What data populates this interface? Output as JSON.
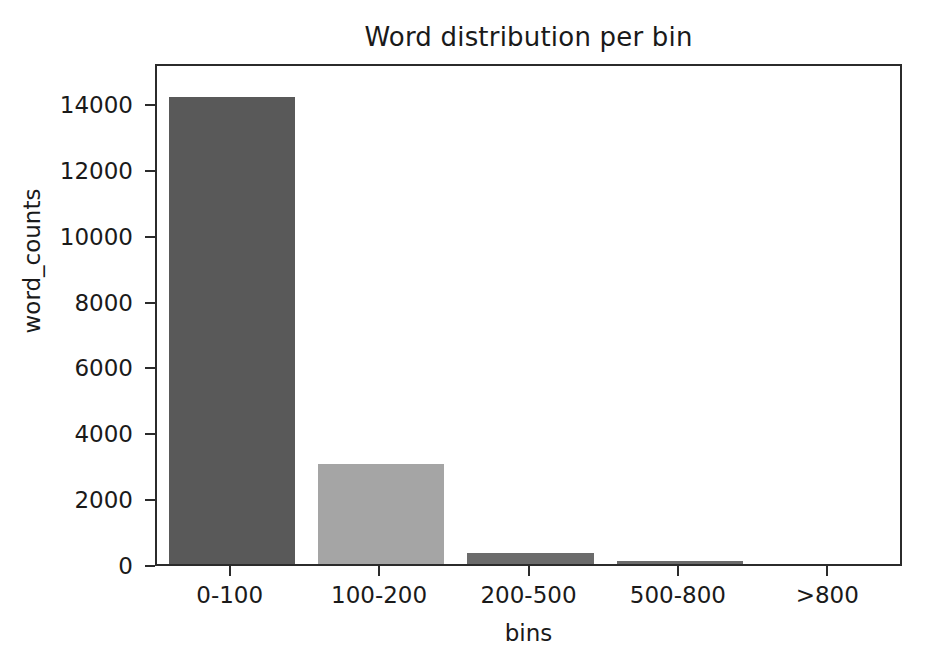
{
  "chart_data": {
    "type": "bar",
    "title": "Word distribution per bin",
    "xlabel": "bins",
    "ylabel": "word_counts",
    "categories": [
      "0-100",
      "100-200",
      "200-500",
      "500-800",
      ">800"
    ],
    "values": [
      14200,
      3050,
      330,
      80,
      10
    ],
    "bar_colors": [
      "#595959",
      "#a5a5a5",
      "#6b6b6b",
      "#6b6b6b",
      "#6b6b6b"
    ],
    "ylim": [
      0,
      15250
    ],
    "yticks": [
      0,
      2000,
      4000,
      6000,
      8000,
      10000,
      12000,
      14000
    ],
    "ytick_labels": [
      "0",
      "2000",
      "4000",
      "6000",
      "8000",
      "10000",
      "12000",
      "14000"
    ],
    "grid": false,
    "legend": "none",
    "axis_color": "#2b2b2b",
    "text_color": "#1a1a1a",
    "background": "#ffffff"
  }
}
